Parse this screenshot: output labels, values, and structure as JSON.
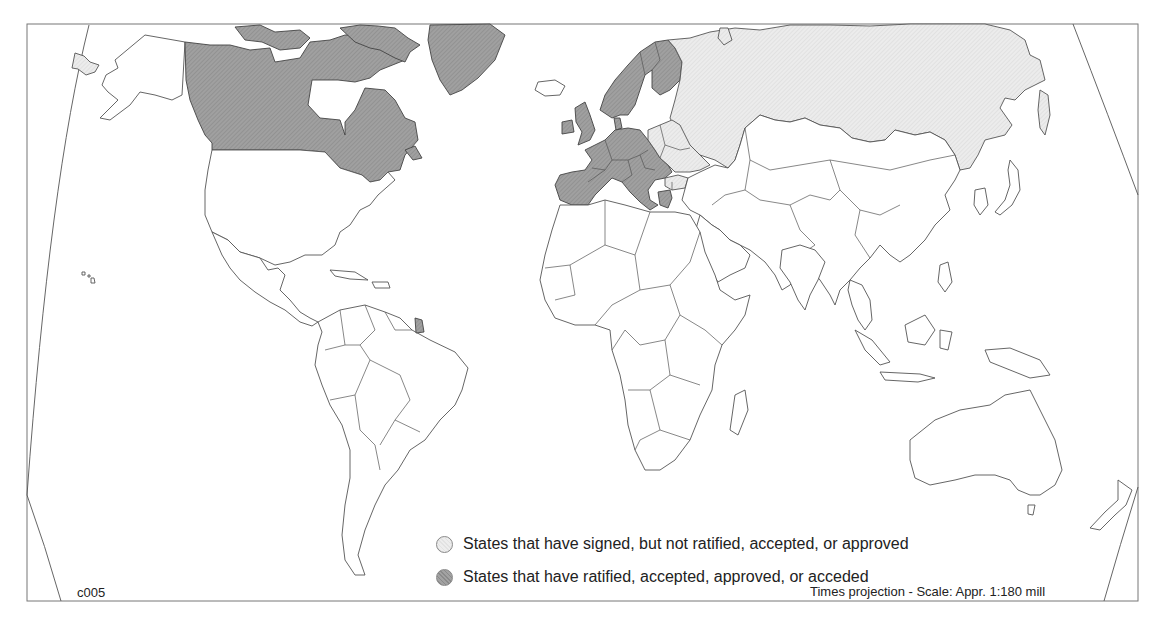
{
  "map": {
    "type": "choropleth world map",
    "projection_note": "Times projection - Scale: Appr. 1:180 mill",
    "code": "c005",
    "colors": {
      "ratified": "#999999",
      "signed": "#e6e6e6",
      "none": "#ffffff",
      "border": "#555555"
    }
  },
  "legend": {
    "items": [
      {
        "key": "signed",
        "label": "States that have signed, but not ratified, accepted, or approved"
      },
      {
        "key": "ratified",
        "label": "States that have ratified, accepted, approved, or acceded"
      }
    ]
  },
  "regions": {
    "ratified": [
      "Canada",
      "Greenland",
      "Norway",
      "Sweden",
      "Finland",
      "Denmark",
      "United Kingdom",
      "Ireland",
      "France",
      "Spain",
      "Portugal",
      "Germany",
      "Netherlands",
      "Belgium",
      "Luxembourg",
      "Switzerland",
      "Austria",
      "Italy",
      "Czech Republic",
      "Slovakia",
      "Hungary",
      "Slovenia",
      "Croatia",
      "Greece",
      "French Guiana"
    ],
    "signed": [
      "Russia",
      "Poland",
      "Belarus",
      "Ukraine",
      "Estonia",
      "Latvia",
      "Lithuania",
      "Romania",
      "Bulgaria"
    ]
  }
}
